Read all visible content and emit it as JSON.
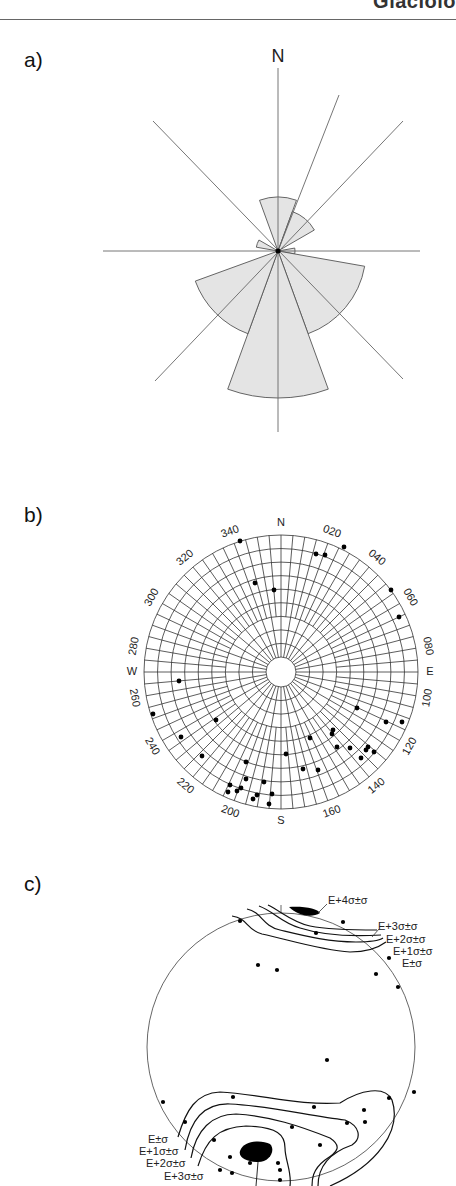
{
  "header": {
    "running_text": "Glaciolo"
  },
  "chart_data": [
    {
      "type": "rose",
      "panel_label": "a)",
      "title": "",
      "north_label": "N",
      "bin_width_deg": 20,
      "center": [
        278,
        251
      ],
      "axis_lines_deg": [
        0,
        22,
        45,
        90,
        135,
        180,
        225,
        315
      ],
      "petals": [
        {
          "from": 340,
          "to": 20,
          "radius": 54
        },
        {
          "from": 20,
          "to": 60,
          "radius": 42
        },
        {
          "from": 80,
          "to": 100,
          "radius": 17
        },
        {
          "from": 100,
          "to": 160,
          "radius": 88
        },
        {
          "from": 160,
          "to": 200,
          "radius": 147
        },
        {
          "from": 200,
          "to": 250,
          "radius": 88
        },
        {
          "from": 280,
          "to": 300,
          "radius": 22
        }
      ],
      "fill": "#e4e4e4",
      "stroke": "#555555"
    },
    {
      "type": "scatter",
      "subtype": "polar-stereonet",
      "panel_label": "b)",
      "center": [
        281,
        672
      ],
      "radius": 137,
      "inner_radius": 15,
      "ring_count": 9,
      "spoke_step_deg": 10,
      "cardinal_labels": {
        "N": "N",
        "E": "E",
        "S": "S",
        "W": "W"
      },
      "azimuth_labels": [
        "020",
        "040",
        "060",
        "080",
        "100",
        "120",
        "140",
        "160",
        "200",
        "220",
        "240",
        "260",
        "280",
        "300",
        "320",
        "340"
      ],
      "points_xy": [
        [
          240,
          541
        ],
        [
          316,
          554
        ],
        [
          325,
          555
        ],
        [
          344,
          547
        ],
        [
          255,
          583
        ],
        [
          274,
          590
        ],
        [
          391,
          590
        ],
        [
          399,
          617
        ],
        [
          179,
          681
        ],
        [
          153,
          714
        ],
        [
          216,
          720
        ],
        [
          181,
          737
        ],
        [
          202,
          756
        ],
        [
          246,
          762
        ],
        [
          237,
          791
        ],
        [
          230,
          785
        ],
        [
          228,
          792
        ],
        [
          241,
          788
        ],
        [
          246,
          779
        ],
        [
          264,
          782
        ],
        [
          253,
          799
        ],
        [
          257,
          795
        ],
        [
          269,
          804
        ],
        [
          272,
          794
        ],
        [
          286,
          754
        ],
        [
          310,
          738
        ],
        [
          332,
          734
        ],
        [
          333,
          730
        ],
        [
          357,
          708
        ],
        [
          386,
          722
        ],
        [
          402,
          722
        ],
        [
          361,
          758
        ],
        [
          337,
          747
        ],
        [
          350,
          748
        ],
        [
          366,
          750
        ],
        [
          368,
          747
        ],
        [
          318,
          770
        ],
        [
          303,
          769
        ],
        [
          374,
          752
        ]
      ],
      "point_color": "#000000"
    },
    {
      "type": "contour",
      "subtype": "density-stereonet",
      "panel_label": "c)",
      "center": [
        281,
        1047
      ],
      "radius": 134,
      "contour_labels_top": [
        "E+4σ±σ",
        "E+3σ±σ",
        "E+2σ±σ",
        "E+1σ±σ",
        "E±σ"
      ],
      "contour_labels_bottom": [
        "E±σ",
        "E+1σ±σ",
        "E+2σ±σ",
        "E+3σ±σ"
      ],
      "points_xy": [
        [
          240,
          921
        ],
        [
          343,
          922
        ],
        [
          316,
          933
        ],
        [
          389,
          958
        ],
        [
          258,
          965
        ],
        [
          277,
          970
        ],
        [
          376,
          974
        ],
        [
          398,
          987
        ],
        [
          327,
          1060
        ],
        [
          163,
          1102
        ],
        [
          233,
          1097
        ],
        [
          314,
          1107
        ],
        [
          414,
          1092
        ],
        [
          389,
          1098
        ],
        [
          364,
          1110
        ],
        [
          185,
          1122
        ],
        [
          365,
          1122
        ],
        [
          347,
          1123
        ],
        [
          292,
          1127
        ],
        [
          214,
          1140
        ],
        [
          320,
          1145
        ],
        [
          230,
          1157
        ],
        [
          250,
          1163
        ],
        [
          278,
          1163
        ],
        [
          280,
          1170
        ],
        [
          220,
          1170
        ],
        [
          232,
          1173
        ],
        [
          280,
          1180
        ]
      ]
    }
  ]
}
